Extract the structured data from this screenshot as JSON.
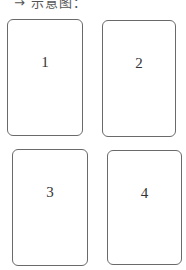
{
  "caption": "→ 示意图：",
  "cards": [
    {
      "label": "1"
    },
    {
      "label": "2"
    },
    {
      "label": "3"
    },
    {
      "label": "4"
    }
  ]
}
